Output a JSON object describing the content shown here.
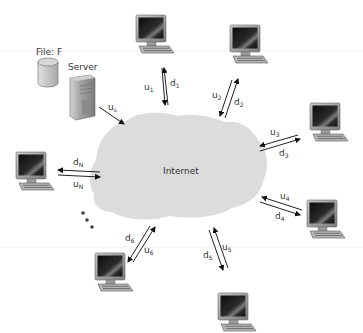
{
  "diagram": {
    "cloud_label": "Internet",
    "file_label": "File: F",
    "server_label": "Server",
    "server_link": {
      "label": "u",
      "sub": "s"
    },
    "peers": [
      {
        "id": "1",
        "up": {
          "label": "u",
          "sub": "1"
        },
        "down": {
          "label": "d",
          "sub": "1"
        }
      },
      {
        "id": "2",
        "up": {
          "label": "u",
          "sub": "2"
        },
        "down": {
          "label": "d",
          "sub": "2"
        }
      },
      {
        "id": "3",
        "up": {
          "label": "u",
          "sub": "3"
        },
        "down": {
          "label": "d",
          "sub": "3"
        }
      },
      {
        "id": "4",
        "up": {
          "label": "u",
          "sub": "4"
        },
        "down": {
          "label": "d",
          "sub": "4"
        }
      },
      {
        "id": "5",
        "up": {
          "label": "u",
          "sub": "5"
        },
        "down": {
          "label": "d",
          "sub": "5"
        }
      },
      {
        "id": "6",
        "up": {
          "label": "u",
          "sub": "6"
        },
        "down": {
          "label": "d",
          "sub": "6"
        }
      },
      {
        "id": "N",
        "up": {
          "label": "u",
          "sub": "N"
        },
        "down": {
          "label": "d",
          "sub": "N"
        }
      }
    ],
    "ellipsis": "...",
    "colors": {
      "cloud": "#dddddd",
      "arrow": "#111111",
      "text": "#333333",
      "screen": "#1a1a1a",
      "monitor_frame": "#9a9a9a",
      "server_body": "#a8a8a8",
      "disk": "#c8c8c8"
    }
  }
}
